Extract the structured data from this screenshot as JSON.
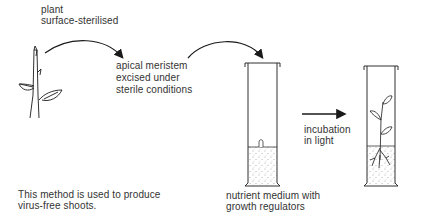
{
  "diagram": {
    "steps": [
      {
        "id": "plant",
        "label_line1": "plant",
        "label_line2": "surface-sterilised"
      },
      {
        "id": "excision",
        "label_line1": "apical meristem",
        "label_line2": "excised under",
        "label_line3": "sterile conditions"
      },
      {
        "id": "medium",
        "label_line1": "nutrient medium with",
        "label_line2": "growth regulators"
      },
      {
        "id": "incubation",
        "label_line1": "incubation",
        "label_line2": "in light"
      }
    ],
    "note": {
      "line1": "This method is used to produce",
      "line2": "virus-free shoots."
    },
    "colors": {
      "line": "#1a1a1a",
      "text": "#333333",
      "background": "#ffffff"
    }
  }
}
